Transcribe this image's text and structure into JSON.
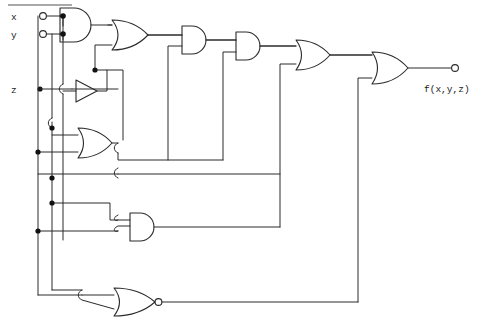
{
  "diagram": {
    "type": "combinational-logic-circuit",
    "line_color": "#2a2a2a",
    "background": "#ffffff"
  },
  "inputs": [
    {
      "id": "x",
      "label": "x",
      "terminal": "open-circle",
      "x": 40,
      "y": 16
    },
    {
      "id": "y",
      "label": "y",
      "terminal": "open-circle",
      "x": 40,
      "y": 34
    },
    {
      "id": "z",
      "label": "z",
      "terminal": "junction-dot",
      "x": 40,
      "y": 89
    }
  ],
  "output": {
    "id": "f",
    "label": "f(x,y,z)",
    "terminal": "open-circle",
    "x": 455,
    "y": 68
  },
  "gates": [
    {
      "id": "and1",
      "type": "AND",
      "symbol": "and-gate",
      "x": 60,
      "y": 25
    },
    {
      "id": "or1",
      "type": "OR",
      "symbol": "or-gate",
      "x": 112,
      "y": 35
    },
    {
      "id": "inv1",
      "type": "NOT",
      "symbol": "inverter",
      "x": 72,
      "y": 91
    },
    {
      "id": "or2",
      "type": "OR",
      "symbol": "or-gate",
      "x": 78,
      "y": 143
    },
    {
      "id": "and2",
      "type": "AND",
      "symbol": "and-gate",
      "x": 130,
      "y": 227
    },
    {
      "id": "and3",
      "type": "AND",
      "symbol": "and-gate",
      "x": 182,
      "y": 40
    },
    {
      "id": "and4",
      "type": "AND",
      "symbol": "and-gate",
      "x": 236,
      "y": 46
    },
    {
      "id": "or3",
      "type": "OR",
      "symbol": "or-gate",
      "x": 296,
      "y": 55
    },
    {
      "id": "or4",
      "type": "OR",
      "symbol": "or-gate",
      "x": 372,
      "y": 68
    },
    {
      "id": "nor1",
      "type": "NOR",
      "symbol": "nor-gate",
      "x": 114,
      "y": 302
    }
  ],
  "junction_dots": [
    {
      "x": 63,
      "y": 16
    },
    {
      "x": 63,
      "y": 34
    },
    {
      "x": 40,
      "y": 89
    },
    {
      "x": 95,
      "y": 70
    },
    {
      "x": 52,
      "y": 128
    },
    {
      "x": 38,
      "y": 152
    },
    {
      "x": 52,
      "y": 178
    },
    {
      "x": 52,
      "y": 203
    },
    {
      "x": 38,
      "y": 231
    }
  ],
  "header_rule": {
    "x1": 8,
    "y1": 5,
    "x2": 72,
    "y2": 5
  }
}
